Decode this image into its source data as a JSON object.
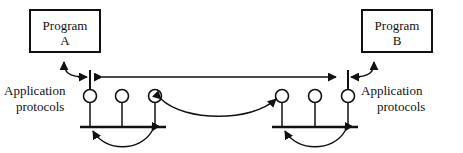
{
  "diagram": {
    "type": "network-protocol-layer-diagram",
    "canvas": {
      "width": 463,
      "height": 153
    },
    "background_color": "#ffffff",
    "line_color": "#111111",
    "boxes": [
      {
        "id": "program-a",
        "line1": "Program",
        "line2": "A",
        "x": 30,
        "y": 10,
        "w": 70,
        "h": 42
      },
      {
        "id": "program-b",
        "line1": "Program",
        "line2": "B",
        "x": 362,
        "y": 10,
        "w": 70,
        "h": 42
      }
    ],
    "labels": {
      "left": {
        "line1": "Application",
        "line2": "protocols",
        "x": 4,
        "y": 84
      },
      "right": {
        "line1": "Application",
        "line2": "protocols",
        "x": 361,
        "y": 84
      }
    },
    "spine": {
      "y": 77,
      "x_start": 90,
      "x_end": 348,
      "endpoints": [
        90,
        348
      ]
    },
    "nodes": {
      "radius": 6.5,
      "center_y": 96,
      "left_group": [
        90,
        122,
        155
      ],
      "right_group": [
        282,
        315,
        348
      ],
      "stem_bottom_y": 127
    },
    "bars": [
      {
        "id": "left-bar",
        "x1": 80,
        "x2": 166,
        "y": 127
      },
      {
        "id": "right-bar",
        "x1": 272,
        "x2": 358,
        "y": 127
      }
    ],
    "arcs": [
      {
        "id": "left-lower-arc",
        "from_x": 155,
        "to_x": 90,
        "y": 127,
        "sag": 18,
        "heads": "both"
      },
      {
        "id": "right-lower-arc",
        "from_x": 348,
        "to_x": 282,
        "y": 127,
        "sag": 18,
        "heads": "both"
      },
      {
        "id": "center-arc",
        "from_x": 155,
        "to_x": 282,
        "y": 96,
        "sag": 22,
        "heads": "both"
      },
      {
        "id": "program-a-hook",
        "heads": "one",
        "target": "program-a"
      },
      {
        "id": "program-b-hook",
        "heads": "one",
        "target": "program-b"
      }
    ]
  }
}
